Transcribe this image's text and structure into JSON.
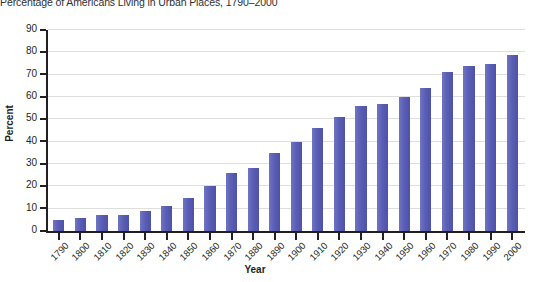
{
  "chart_data": {
    "type": "bar",
    "title": "Percentage of Americans Living in Urban Places, 1790–2000",
    "xlabel": "Year",
    "ylabel": "Percent",
    "categories": [
      "1790",
      "1800",
      "1810",
      "1820",
      "1830",
      "1840",
      "1850",
      "1860",
      "1870",
      "1880",
      "1890",
      "1900",
      "1910",
      "1920",
      "1930",
      "1940",
      "1950",
      "1960",
      "1970",
      "1980",
      "1990",
      "2000"
    ],
    "values": [
      5,
      6,
      7,
      7,
      9,
      11,
      15,
      20,
      26,
      28,
      35,
      40,
      46,
      51,
      56,
      57,
      60,
      64,
      71,
      74,
      75,
      79
    ],
    "ylim": [
      0,
      90
    ],
    "yticks": [
      0,
      10,
      20,
      30,
      40,
      50,
      60,
      70,
      80,
      90
    ],
    "grid": true,
    "legend": "none",
    "bar_color": "#5f64ba"
  },
  "axis": {
    "y_title": "Percent",
    "x_title": "Year"
  }
}
